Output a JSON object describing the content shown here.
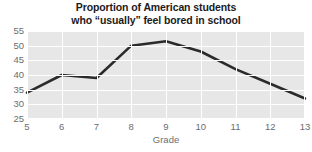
{
  "chart_data": {
    "type": "line",
    "title": "Proportion of American students who “usually” feel bored in school",
    "title_lines": [
      "Proportion of American students",
      "who “usually” feel bored in school"
    ],
    "xlabel": "Grade",
    "ylabel": "",
    "x": [
      5,
      6,
      7,
      8,
      9,
      10,
      11,
      12,
      13
    ],
    "categories": [
      "5",
      "6",
      "7",
      "8",
      "9",
      "10",
      "11",
      "12",
      "13"
    ],
    "values": [
      34,
      40,
      39,
      50,
      51.5,
      48,
      42,
      37,
      32
    ],
    "series": [
      {
        "name": "Percent usually bored",
        "values": [
          34,
          40,
          39,
          50,
          51.5,
          48,
          42,
          37,
          32
        ],
        "color": "#2b2b2b"
      }
    ],
    "xlim": [
      5,
      13
    ],
    "ylim": [
      25,
      55
    ],
    "yticks": [
      25,
      30,
      35,
      40,
      45,
      50,
      55
    ],
    "ytick_labels": [
      "25",
      "30",
      "35",
      "40",
      "45",
      "50",
      "55"
    ],
    "xticks": [
      5,
      6,
      7,
      8,
      9,
      10,
      11,
      12,
      13
    ],
    "xtick_labels": [
      "5",
      "6",
      "7",
      "8",
      "9",
      "10",
      "11",
      "12",
      "13"
    ],
    "grid": true,
    "grid_color": "#ffffff",
    "plot_background": "#e7e7e7",
    "figure_background": "#ffffff",
    "legend": null,
    "legend_position": "none",
    "markers": false,
    "line_width": 2.6,
    "annotations": []
  },
  "style": {
    "tick_label_color": "#6d6d6d",
    "title_color": "#1b1b1b",
    "line_color": "#2b2b2b"
  }
}
